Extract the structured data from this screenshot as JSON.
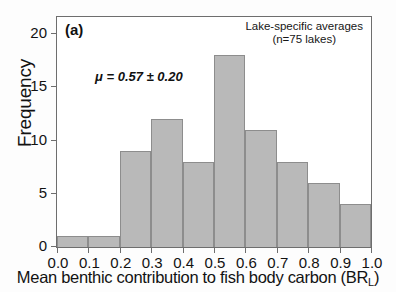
{
  "chart_data": {
    "type": "bar",
    "title": "",
    "panel_label": "(a)",
    "xlabel_text": "Mean benthic contribution to fish body carbon (BR",
    "xlabel_subscript": "L",
    "xlabel_suffix": ")",
    "ylabel": "Frequency",
    "categories": [
      "0.0-0.1",
      "0.1-0.2",
      "0.2-0.3",
      "0.3-0.4",
      "0.4-0.5",
      "0.5-0.6",
      "0.6-0.7",
      "0.7-0.8",
      "0.8-0.9",
      "0.9-1.0"
    ],
    "bin_edges": [
      0.0,
      0.1,
      0.2,
      0.3,
      0.4,
      0.5,
      0.6,
      0.7,
      0.8,
      0.9,
      1.0
    ],
    "values": [
      1,
      1,
      9,
      12,
      8,
      18,
      11,
      8,
      6,
      4
    ],
    "xlim": [
      0.0,
      1.0
    ],
    "ylim": [
      0,
      21.6
    ],
    "xticks": [
      "0.0",
      "0.1",
      "0.2",
      "0.3",
      "0.4",
      "0.5",
      "0.6",
      "0.7",
      "0.8",
      "0.9",
      "1.0"
    ],
    "xtick_values": [
      0.0,
      0.1,
      0.2,
      0.3,
      0.4,
      0.5,
      0.6,
      0.7,
      0.8,
      0.9,
      1.0
    ],
    "yticks": [
      "0",
      "5",
      "10",
      "15",
      "20"
    ],
    "ytick_values": [
      0,
      5,
      10,
      15,
      20
    ],
    "grid": false,
    "legend_position": "top-right",
    "annotations": [
      {
        "name": "mean-annotation",
        "text": "μ = 0.57 ± 0.20",
        "mean": 0.57,
        "sd": 0.2
      },
      {
        "name": "sample-note-line1",
        "text": "Lake-specific averages"
      },
      {
        "name": "sample-note-line2",
        "text": "(n=75 lakes)",
        "n": 75
      }
    ],
    "colors": {
      "bar_fill": "#b9b9b9",
      "bar_border": "#8d8d8d",
      "axis": "#6e6e6e",
      "text": "#121212",
      "background": "#fdfdfd",
      "plot_background": "#ffffff"
    }
  },
  "legend": {
    "line1": "Lake-specific averages",
    "line2": "(n=75 lakes)"
  },
  "annotation": {
    "mean_text": "μ = 0.57 ± 0.20"
  },
  "panel": {
    "label": "(a)"
  },
  "axes": {
    "y_title": "Frequency"
  }
}
